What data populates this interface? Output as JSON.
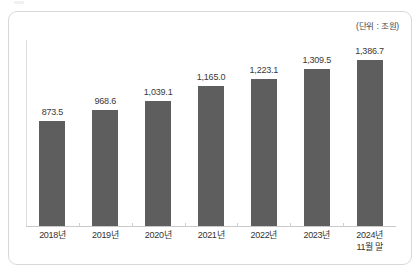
{
  "unit_note": "(단위 : 조원)",
  "chart_data": {
    "type": "bar",
    "title": "",
    "subtitle": "",
    "xlabel": "",
    "ylabel": "",
    "unit": "조원",
    "unit_note": "(단위 : 조원)",
    "grid": false,
    "legend": false,
    "legend_position": "none",
    "axis_y_visible": true,
    "axis_x_visible": true,
    "ylim": [
      0,
      1550
    ],
    "bar_color": "#5e5e5e",
    "value_label_color": "#3a3a3a",
    "categories": [
      "2018년",
      "2019년",
      "2020년",
      "2021년",
      "2022년",
      "2023년",
      "2024년 11월 말"
    ],
    "category_lines": [
      [
        "2018년"
      ],
      [
        "2019년"
      ],
      [
        "2020년"
      ],
      [
        "2021년"
      ],
      [
        "2022년"
      ],
      [
        "2023년"
      ],
      [
        "2024년",
        "11월 말"
      ]
    ],
    "values": [
      873.5,
      968.6,
      1039.1,
      1165.0,
      1223.1,
      1309.5,
      1386.7
    ],
    "value_labels": [
      "873.5",
      "968.6",
      "1,039.1",
      "1,165.0",
      "1,223.1",
      "1,309.5",
      "1,386.7"
    ]
  }
}
